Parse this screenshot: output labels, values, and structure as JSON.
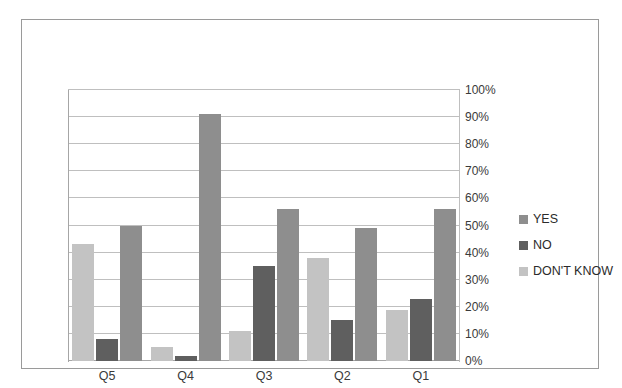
{
  "page": {
    "cropped_header_text": "",
    "background_color": "#ffffff",
    "frame_border_color": "#9a9a9a"
  },
  "chart_data": {
    "type": "bar",
    "title": "",
    "subtitle": "",
    "xlabel": "",
    "ylabel": "",
    "categories": [
      "Q5",
      "Q4",
      "Q3",
      "Q2",
      "Q1"
    ],
    "series": [
      {
        "name": "DON'T KNOW",
        "color": "#c3c3c3",
        "values": [
          43,
          5,
          11,
          38,
          19
        ]
      },
      {
        "name": "NO",
        "color": "#5f5f5f",
        "values": [
          8,
          2,
          35,
          15,
          23
        ]
      },
      {
        "name": "YES",
        "color": "#8e8e8e",
        "values": [
          50,
          91,
          56,
          49,
          56
        ]
      }
    ],
    "legend_entries": [
      "YES",
      "NO",
      "DON'T KNOW"
    ],
    "legend_colors": [
      "#8e8e8e",
      "#5f5f5f",
      "#c3c3c3"
    ],
    "legend_position": "right",
    "ylim": [
      0,
      100
    ],
    "y_tick_values": [
      0,
      10,
      20,
      30,
      40,
      50,
      60,
      70,
      80,
      90,
      100
    ],
    "y_tick_labels": [
      "0%",
      "10%",
      "20%",
      "30%",
      "40%",
      "50%",
      "60%",
      "70%",
      "80%",
      "90%",
      "100%"
    ],
    "y_axis_position": "right",
    "grid": true,
    "grid_color": "#bfbfbf",
    "value_unit": "%"
  }
}
